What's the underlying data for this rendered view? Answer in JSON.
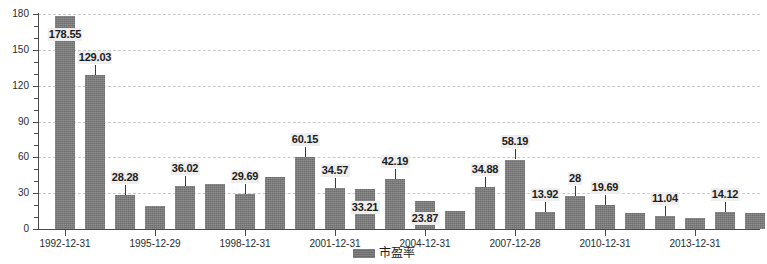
{
  "chart_data": {
    "type": "bar",
    "title": "",
    "xlabel": "",
    "ylabel": "",
    "ylim": [
      0,
      180
    ],
    "yticks": [
      0,
      30,
      60,
      90,
      120,
      150,
      180
    ],
    "grid": true,
    "legend_position": "bottom",
    "series_name": "市盈率",
    "bar_color": "#6d6d6d",
    "categories": [
      "1992-12-31",
      "1993-12-31",
      "1994-12-31",
      "1995-12-29",
      "1996-12-31",
      "1997-12-31",
      "1998-12-31",
      "1999-12-31",
      "2000-12-29",
      "2001-12-31",
      "2002-12-31",
      "2003-12-31",
      "2004-12-31",
      "2005-12-30",
      "2006-12-29",
      "2007-12-28",
      "2008-12-31",
      "2009-12-31",
      "2010-12-31",
      "2011-12-30",
      "2012-12-31",
      "2013-12-31",
      "2014-12-31",
      "2015-12-31"
    ],
    "values": [
      178.55,
      129.03,
      28.28,
      19.0,
      36.02,
      37.6,
      29.69,
      43.5,
      60.15,
      34.57,
      33.21,
      42.19,
      23.87,
      14.8,
      34.88,
      58.19,
      13.92,
      28.0,
      19.69,
      13.0,
      11.04,
      9.2,
      14.12,
      13.8
    ],
    "axis_tick_labels": [
      "1992-12-31",
      "1995-12-29",
      "1998-12-31",
      "2001-12-31",
      "2004-12-31",
      "2007-12-28",
      "2010-12-31",
      "2013-12-31"
    ],
    "axis_tick_indices": [
      0,
      3,
      6,
      9,
      12,
      15,
      18,
      21
    ],
    "labeled_points": [
      {
        "index": 0,
        "value": 178.55,
        "text": "178.55",
        "above": false
      },
      {
        "index": 1,
        "value": 129.03,
        "text": "129.03",
        "above": true
      },
      {
        "index": 2,
        "value": 28.28,
        "text": "28.28",
        "above": true
      },
      {
        "index": 4,
        "value": 36.02,
        "text": "36.02",
        "above": true
      },
      {
        "index": 6,
        "value": 29.69,
        "text": "29.69",
        "above": true
      },
      {
        "index": 8,
        "value": 60.15,
        "text": "60.15",
        "above": true
      },
      {
        "index": 9,
        "value": 34.57,
        "text": "34.57",
        "above": true
      },
      {
        "index": 10,
        "value": 33.21,
        "text": "33.21",
        "above": false
      },
      {
        "index": 11,
        "value": 42.19,
        "text": "42.19",
        "above": true
      },
      {
        "index": 12,
        "value": 23.87,
        "text": "23.87",
        "above": false
      },
      {
        "index": 14,
        "value": 34.88,
        "text": "34.88",
        "above": true
      },
      {
        "index": 15,
        "value": 58.19,
        "text": "58.19",
        "above": true
      },
      {
        "index": 16,
        "value": 13.92,
        "text": "13.92",
        "above": true
      },
      {
        "index": 17,
        "value": 28.0,
        "text": "28",
        "above": true
      },
      {
        "index": 18,
        "value": 19.69,
        "text": "19.69",
        "above": true
      },
      {
        "index": 20,
        "value": 11.04,
        "text": "11.04",
        "above": true
      },
      {
        "index": 22,
        "value": 14.12,
        "text": "14.12",
        "above": true
      }
    ]
  },
  "legend": {
    "label": "市盈率"
  },
  "yaxis": {
    "labels": [
      "180",
      "150",
      "120",
      "90",
      "60",
      "30",
      "0"
    ]
  }
}
